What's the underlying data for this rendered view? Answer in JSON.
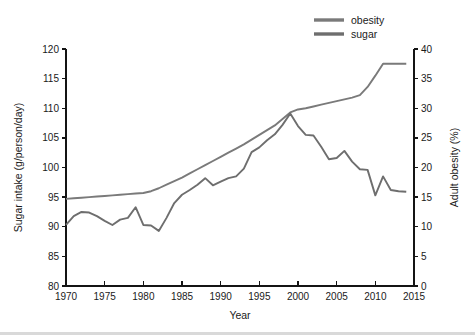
{
  "chart_data": {
    "type": "line",
    "title": "",
    "xlabel": "Year",
    "ylabel": "Sugar intake (g/person/day)",
    "y2label": "Adult obesity (%)",
    "xlim": [
      1970,
      2015
    ],
    "ylim": [
      80,
      120
    ],
    "y2lim": [
      0,
      40
    ],
    "xticks": [
      1970,
      1975,
      1980,
      1985,
      1990,
      1995,
      2000,
      2005,
      2010,
      2015
    ],
    "yticks": [
      80,
      85,
      90,
      95,
      100,
      105,
      110,
      115,
      120
    ],
    "y2ticks": [
      0,
      5,
      10,
      15,
      20,
      25,
      30,
      35,
      40
    ],
    "grid": false,
    "legend_position": "top-right",
    "legend": [
      "obesity",
      "sugar"
    ],
    "series": [
      {
        "name": "obesity",
        "axis": "right",
        "units": "%",
        "color": "#7a7a7a",
        "x": [
          1970,
          1971,
          1972,
          1973,
          1974,
          1975,
          1976,
          1977,
          1978,
          1979,
          1980,
          1981,
          1982,
          1983,
          1984,
          1985,
          1986,
          1987,
          1988,
          1989,
          1990,
          1991,
          1992,
          1993,
          1994,
          1995,
          1996,
          1997,
          1998,
          1999,
          2000,
          2001,
          2002,
          2003,
          2004,
          2005,
          2006,
          2007,
          2008,
          2009,
          2010,
          2011,
          2012,
          2013,
          2014
        ],
        "values": [
          14.7,
          14.8,
          14.9,
          15.0,
          15.1,
          15.2,
          15.3,
          15.4,
          15.5,
          15.6,
          15.7,
          16.0,
          16.5,
          17.1,
          17.7,
          18.3,
          19.0,
          19.7,
          20.4,
          21.1,
          21.8,
          22.5,
          23.2,
          23.9,
          24.7,
          25.5,
          26.3,
          27.1,
          28.2,
          29.3,
          29.8,
          30.0,
          30.3,
          30.6,
          30.9,
          31.2,
          31.5,
          31.8,
          32.2,
          33.6,
          35.5,
          37.5,
          37.5,
          37.5,
          37.5
        ]
      },
      {
        "name": "sugar",
        "axis": "left",
        "units": "g/person/day",
        "color": "#6e6e6e",
        "x": [
          1970,
          1971,
          1972,
          1973,
          1974,
          1975,
          1976,
          1977,
          1978,
          1979,
          1980,
          1981,
          1982,
          1983,
          1984,
          1985,
          1986,
          1987,
          1988,
          1989,
          1990,
          1991,
          1992,
          1993,
          1994,
          1995,
          1996,
          1997,
          1998,
          1999,
          2000,
          2001,
          2002,
          2003,
          2004,
          2005,
          2006,
          2007,
          2008,
          2009,
          2010,
          2011,
          2012,
          2013,
          2014
        ],
        "values": [
          90.3,
          91.8,
          92.5,
          92.4,
          91.8,
          91.0,
          90.3,
          91.2,
          91.5,
          93.3,
          90.3,
          90.2,
          89.3,
          91.5,
          94.0,
          95.4,
          96.2,
          97.1,
          98.2,
          97.0,
          97.6,
          98.2,
          98.5,
          99.8,
          102.6,
          103.4,
          104.6,
          105.6,
          107.2,
          109.1,
          107.0,
          105.5,
          105.4,
          103.5,
          101.4,
          101.6,
          102.8,
          101.0,
          99.7,
          99.6,
          95.3,
          98.5,
          96.2,
          96.0,
          95.9
        ]
      }
    ]
  },
  "legend": {
    "items": [
      {
        "label": "obesity",
        "color": "#7a7a7a"
      },
      {
        "label": "sugar",
        "color": "#6e6e6e"
      }
    ]
  },
  "axes": {
    "x_title": "Year",
    "y_left_title": "Sugar intake (g/person/day)",
    "y_right_title": "Adult obesity (%)",
    "x_ticks": [
      "1970",
      "1975",
      "1980",
      "1985",
      "1990",
      "1995",
      "2000",
      "2005",
      "2010",
      "2015"
    ],
    "y_left_ticks": [
      "120",
      "115",
      "110",
      "105",
      "100",
      "95",
      "90",
      "85",
      "80"
    ],
    "y_right_ticks": [
      "40",
      "35",
      "30",
      "25",
      "20",
      "15",
      "10",
      "5",
      "0"
    ]
  },
  "colors": {
    "axis": "#141414",
    "text": "#1a1a1a",
    "background": "#ffffff",
    "bottom_rule": "#d9d9d9"
  }
}
